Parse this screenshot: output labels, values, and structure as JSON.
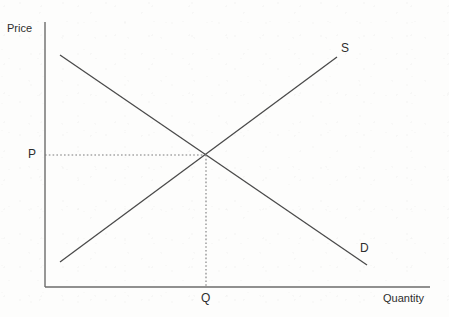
{
  "chart_data": {
    "type": "line",
    "title": "",
    "xlabel": "Quantity",
    "ylabel": "Price",
    "grid": false,
    "legend": "inline-curve-labels",
    "axis_origin": {
      "x": 45,
      "y": 287
    },
    "axis_extent": {
      "x_end": 430,
      "y_top": 22
    },
    "xlim": [
      0,
      1
    ],
    "ylim": [
      0,
      1
    ],
    "series": [
      {
        "name": "S",
        "label": "S",
        "description": "Supply curve, upward sloping",
        "points": [
          {
            "x": 60,
            "y": 262
          },
          {
            "x": 337,
            "y": 57
          }
        ],
        "label_position": {
          "x": 341,
          "y": 42
        }
      },
      {
        "name": "D",
        "label": "D",
        "description": "Demand curve, downward sloping",
        "points": [
          {
            "x": 60,
            "y": 55
          },
          {
            "x": 367,
            "y": 265
          }
        ],
        "label_position": {
          "x": 360,
          "y": 242
        }
      }
    ],
    "equilibrium": {
      "x": 206,
      "y": 155,
      "price_label": "P",
      "quantity_label": "Q",
      "guide_lines": [
        {
          "type": "horizontal",
          "from": {
            "x": 45,
            "y": 155
          },
          "to": {
            "x": 206,
            "y": 155
          },
          "style": "dotted"
        },
        {
          "type": "vertical",
          "from": {
            "x": 206,
            "y": 155
          },
          "to": {
            "x": 206,
            "y": 287
          },
          "style": "dotted"
        }
      ]
    },
    "annotations": [
      {
        "text": "Price",
        "role": "y-axis-title"
      },
      {
        "text": "Quantity",
        "role": "x-axis-title"
      },
      {
        "text": "P",
        "role": "equilibrium-price-tick"
      },
      {
        "text": "Q",
        "role": "equilibrium-quantity-tick"
      },
      {
        "text": "S",
        "role": "supply-curve-label"
      },
      {
        "text": "D",
        "role": "demand-curve-label"
      }
    ]
  },
  "labels": {
    "price": "Price",
    "quantity": "Quantity",
    "equilibrium_price": "P",
    "equilibrium_quantity": "Q",
    "supply": "S",
    "demand": "D"
  },
  "colors": {
    "background": "#fdfdfc",
    "line": "#4a4a4a",
    "axis": "#6b6b6b",
    "guide": "#7a7a7a",
    "text": "#2d2d2d"
  }
}
